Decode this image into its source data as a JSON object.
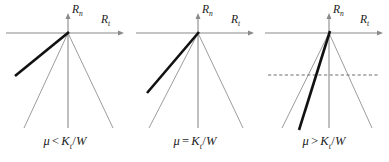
{
  "figure": {
    "panel_count": 3,
    "colors": {
      "axis": "#8a8a8a",
      "cone": "#8a8a8a",
      "bold_line": "#111111",
      "dashed_line": "#6f6f6f",
      "text": "#1a1a1a",
      "background": "#ffffff"
    }
  },
  "axes": {
    "vertical_label": "R",
    "vertical_sub": "n",
    "horizontal_label": "R",
    "horizontal_sub": "t"
  },
  "panels": [
    {
      "id": "panel-less-than",
      "caption": {
        "mu": "μ",
        "operator": "<",
        "numerator": "K",
        "numerator_sub": "t",
        "denominator": "W",
        "full": "μ < Kₜ/W"
      },
      "bold_line": {
        "description": "shallow resultant line inside friction cone",
        "x1": 68,
        "y1": 33,
        "x2": 15,
        "y2": 76
      },
      "has_dashed_line": false,
      "dashed_line_y": null
    },
    {
      "id": "panel-equal",
      "caption": {
        "mu": "μ",
        "operator": "=",
        "numerator": "K",
        "numerator_sub": "t",
        "denominator": "W",
        "full": "μ = Kₜ/W"
      },
      "bold_line": {
        "description": "resultant line coincident with left cone edge",
        "x1": 68,
        "y1": 33,
        "x2": 17,
        "y2": 93
      },
      "has_dashed_line": false,
      "dashed_line_y": null
    },
    {
      "id": "panel-greater-than",
      "caption": {
        "mu": "μ",
        "operator": ">",
        "numerator": "K",
        "numerator_sub": "t",
        "denominator": "W",
        "full": "μ > Kₜ/W"
      },
      "bold_line": {
        "description": "steep resultant line crossing outside friction cone",
        "x1": 70,
        "y1": 30,
        "x2": 40,
        "y2": 130
      },
      "has_dashed_line": true,
      "dashed_line_y": 75
    }
  ],
  "geometry": {
    "origin_x": 68,
    "origin_y": 33,
    "axis_left_x": 6,
    "axis_right_x": 124,
    "vertical_top_y": 14,
    "vertical_bottom_y": 128,
    "cone_left_x": 24,
    "cone_right_x": 113,
    "cone_bottom_y": 128
  }
}
